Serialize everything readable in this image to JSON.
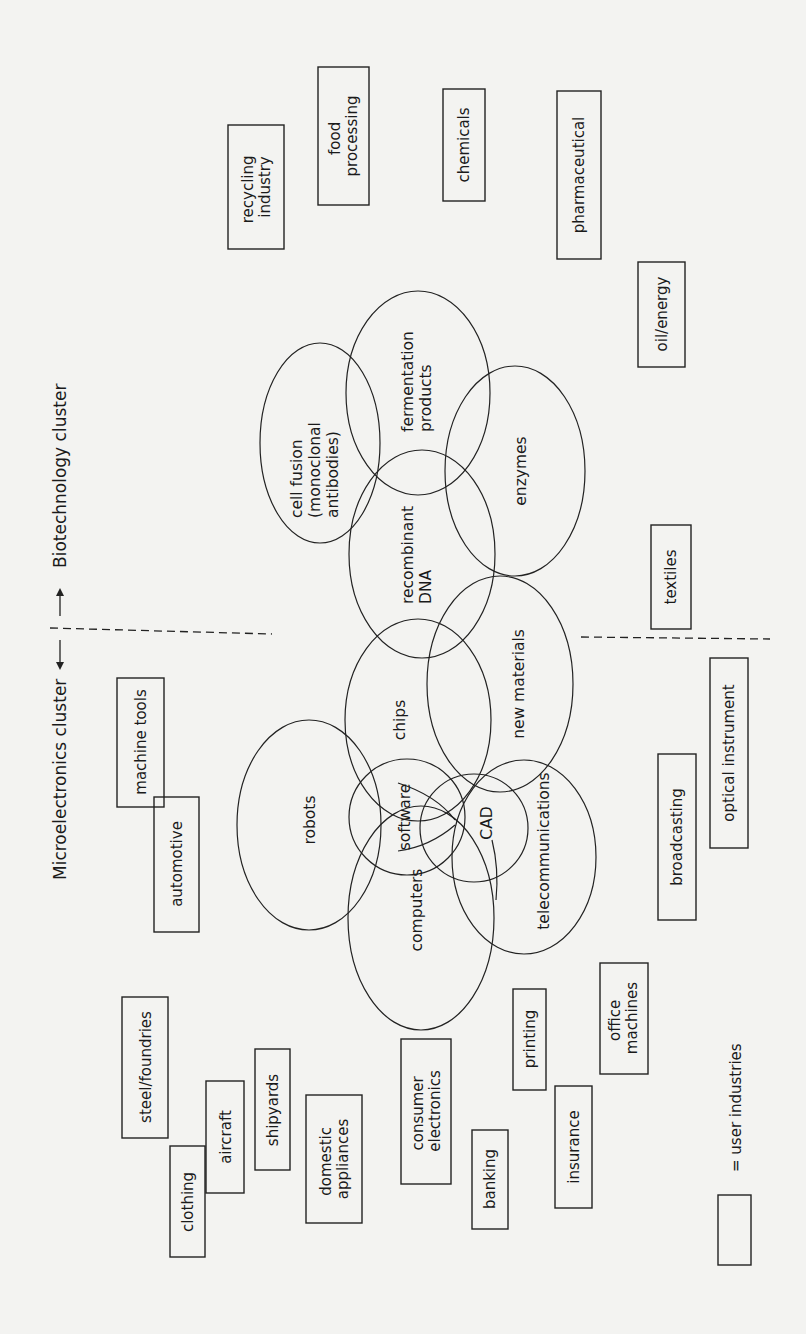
{
  "figure": {
    "orientation": "rotated-90-ccw",
    "background_color": "#f3f3f1",
    "line_color": "#222222"
  },
  "clusters": {
    "microelectronics_label": "Microelectronics cluster",
    "biotechnology_label": "Biotechnology cluster",
    "arrow_down": "↓",
    "arrow_up": "↑"
  },
  "technologies": [
    {
      "id": "cell-fusion",
      "lines": [
        "cell fusion",
        "(monoclonal",
        "antibodies)"
      ],
      "cluster": "biotechnology"
    },
    {
      "id": "fermentation-products",
      "lines": [
        "fermentation",
        "products"
      ],
      "cluster": "biotechnology"
    },
    {
      "id": "enzymes",
      "lines": [
        "enzymes"
      ],
      "cluster": "biotechnology"
    },
    {
      "id": "recombinant-dna",
      "lines": [
        "recombinant",
        "DNA"
      ],
      "cluster": "biotechnology"
    },
    {
      "id": "new-materials",
      "lines": [
        "new materials"
      ],
      "cluster": "shared"
    },
    {
      "id": "chips",
      "lines": [
        "chips"
      ],
      "cluster": "microelectronics"
    },
    {
      "id": "robots",
      "lines": [
        "robots"
      ],
      "cluster": "microelectronics"
    },
    {
      "id": "software",
      "lines": [
        "software"
      ],
      "cluster": "microelectronics"
    },
    {
      "id": "cad",
      "lines": [
        "CAD"
      ],
      "cluster": "microelectronics"
    },
    {
      "id": "computers",
      "lines": [
        "computers"
      ],
      "cluster": "microelectronics"
    },
    {
      "id": "telecommunications",
      "lines": [
        "telecommunications"
      ],
      "cluster": "microelectronics"
    }
  ],
  "user_industries": [
    {
      "id": "recycling-industry",
      "lines": [
        "recycling",
        "industry"
      ]
    },
    {
      "id": "food-processing",
      "lines": [
        "food",
        "processing"
      ]
    },
    {
      "id": "chemicals",
      "lines": [
        "chemicals"
      ]
    },
    {
      "id": "pharmaceutical",
      "lines": [
        "pharmaceutical"
      ]
    },
    {
      "id": "oil-energy",
      "lines": [
        "oil/energy"
      ]
    },
    {
      "id": "textiles",
      "lines": [
        "textiles"
      ]
    },
    {
      "id": "optical-instrument",
      "lines": [
        "optical instrument"
      ]
    },
    {
      "id": "broadcasting",
      "lines": [
        "broadcasting"
      ]
    },
    {
      "id": "machine-tools",
      "lines": [
        "machine tools"
      ]
    },
    {
      "id": "automotive",
      "lines": [
        "automotive"
      ]
    },
    {
      "id": "steel-foundries",
      "lines": [
        "steel/foundries"
      ]
    },
    {
      "id": "aircraft",
      "lines": [
        "aircraft"
      ]
    },
    {
      "id": "shipyards",
      "lines": [
        "shipyards"
      ]
    },
    {
      "id": "clothing",
      "lines": [
        "clothing"
      ]
    },
    {
      "id": "domestic-appliances",
      "lines": [
        "domestic",
        "appliances"
      ]
    },
    {
      "id": "consumer-electronics",
      "lines": [
        "consumer",
        "electronics"
      ]
    },
    {
      "id": "banking",
      "lines": [
        "banking"
      ]
    },
    {
      "id": "printing",
      "lines": [
        "printing"
      ]
    },
    {
      "id": "insurance",
      "lines": [
        "insurance"
      ]
    },
    {
      "id": "office-machines",
      "lines": [
        "office",
        "machines"
      ]
    }
  ],
  "legend": {
    "label": "= user industries"
  }
}
